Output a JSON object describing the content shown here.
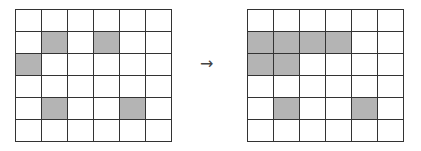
{
  "diagram": {
    "rows": 6,
    "cols": 6,
    "colors": {
      "filled": "#b4b4b4",
      "empty": "#ffffff",
      "line": "#333333"
    },
    "arrow": "→",
    "input_grid": {
      "filled_cells": [
        [
          1,
          1
        ],
        [
          1,
          3
        ],
        [
          2,
          0
        ],
        [
          4,
          1
        ],
        [
          4,
          4
        ]
      ]
    },
    "output_grid": {
      "filled_cells": [
        [
          1,
          0
        ],
        [
          1,
          1
        ],
        [
          1,
          2
        ],
        [
          1,
          3
        ],
        [
          2,
          0
        ],
        [
          2,
          1
        ],
        [
          4,
          1
        ],
        [
          4,
          4
        ]
      ]
    }
  }
}
